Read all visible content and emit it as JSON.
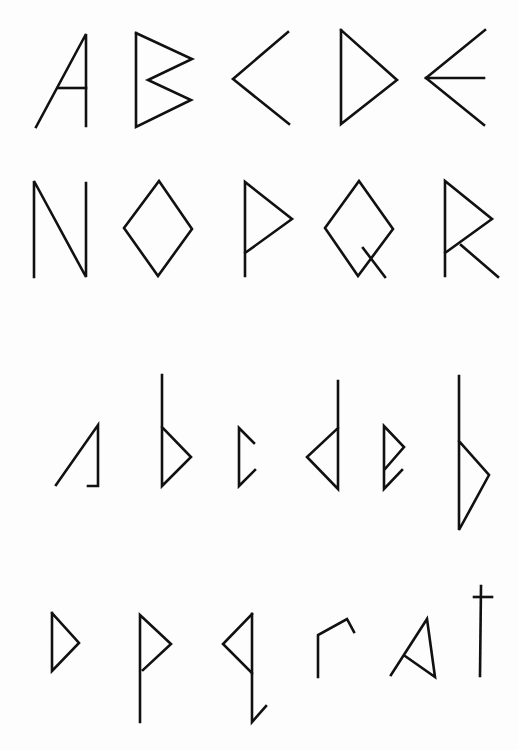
{
  "page": {
    "background": "#fdfdfd",
    "ink": "#111111"
  },
  "rows": [
    {
      "name": "uppercase-row-1",
      "glyphs": [
        "A",
        "B",
        "C",
        "D",
        "E"
      ]
    },
    {
      "name": "uppercase-row-2",
      "glyphs": [
        "N",
        "O",
        "P",
        "Q",
        "R"
      ]
    },
    {
      "name": "lowercase-row-1",
      "glyphs": [
        "a",
        "b",
        "c",
        "d",
        "e",
        "f"
      ]
    },
    {
      "name": "lowercase-row-2",
      "glyphs": [
        "p",
        "p",
        "q",
        "r",
        "a",
        "t"
      ]
    }
  ]
}
